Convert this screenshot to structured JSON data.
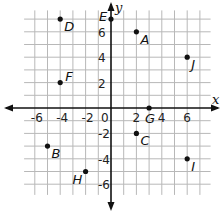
{
  "plane": {
    "origin_px": [
      111,
      108
    ],
    "unit_px": 12.7,
    "grid_range": {
      "xmin": -7,
      "xmax": 8,
      "ymin": -7,
      "ymax": 8
    },
    "grid_color": "#b8b8b8",
    "axis_color": "#111111",
    "x_axis_label": "x",
    "y_axis_label": "y",
    "x_tick_labels": [
      {
        "value": -6,
        "text": "-6"
      },
      {
        "value": -4,
        "text": "-4"
      },
      {
        "value": -2,
        "text": "-2"
      },
      {
        "value": 0,
        "text": "0"
      },
      {
        "value": 2,
        "text": "2"
      },
      {
        "value": 4,
        "text": "4"
      },
      {
        "value": 6,
        "text": "6"
      }
    ],
    "y_tick_labels": [
      {
        "value": 6,
        "text": "6"
      },
      {
        "value": 4,
        "text": "4"
      },
      {
        "value": 2,
        "text": "2"
      },
      {
        "value": -2,
        "text": "-2"
      },
      {
        "value": -4,
        "text": "-4"
      },
      {
        "value": -6,
        "text": "-6"
      }
    ],
    "points": [
      {
        "label": "A",
        "x": 2,
        "y": 6,
        "label_dx": 4,
        "label_dy": 12
      },
      {
        "label": "B",
        "x": -5,
        "y": -3,
        "label_dx": 4,
        "label_dy": 12
      },
      {
        "label": "C",
        "x": 2,
        "y": -2,
        "label_dx": 4,
        "label_dy": 12
      },
      {
        "label": "D",
        "x": -4,
        "y": 7,
        "label_dx": 4,
        "label_dy": 12
      },
      {
        "label": "E",
        "x": 0,
        "y": 7,
        "label_dx": -12,
        "label_dy": 2
      },
      {
        "label": "F",
        "x": -4,
        "y": 2,
        "label_dx": 5,
        "label_dy": -2
      },
      {
        "label": "G",
        "x": 3,
        "y": 0,
        "label_dx": -4,
        "label_dy": 15
      },
      {
        "label": "H",
        "x": -2,
        "y": -5,
        "label_dx": -13,
        "label_dy": 12
      },
      {
        "label": "I",
        "x": 6,
        "y": -4,
        "label_dx": 4,
        "label_dy": 12
      },
      {
        "label": "J",
        "x": 6,
        "y": 4,
        "label_dx": 4,
        "label_dy": 12
      }
    ]
  }
}
